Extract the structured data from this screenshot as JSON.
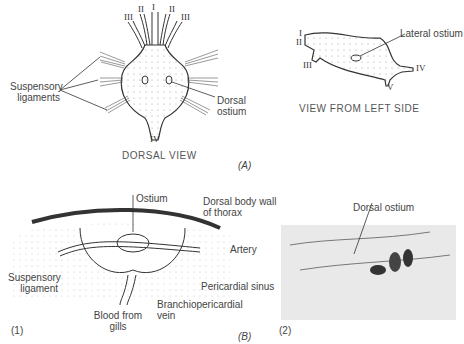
{
  "panel_a": {
    "panel_label": "(A)",
    "dorsal_view": {
      "caption": "DORSAL VIEW",
      "labels": {
        "suspensory_ligaments": [
          "Suspensory",
          "ligaments"
        ],
        "dorsal_ostium": [
          "Dorsal",
          "ostium"
        ]
      },
      "arteries": {
        "top_center": "I",
        "top_left_inner": "II",
        "top_right_inner": "II",
        "top_left_outer": "III",
        "top_right_outer": "III",
        "bottom": "IV"
      }
    },
    "side_view": {
      "caption": "VIEW FROM LEFT SIDE",
      "labels": {
        "lateral_ostium": "Lateral ostium"
      },
      "arteries": {
        "a1": "I",
        "a2": "II",
        "a3": "III",
        "a4": "IV",
        "a5": "V"
      }
    }
  },
  "panel_b": {
    "panel_label": "(B)",
    "fig1": {
      "number": "(1)",
      "labels": {
        "ostium": "Ostium",
        "dorsal_body_wall": [
          "Dorsal body wall",
          "of thorax"
        ],
        "artery": "Artery",
        "suspensory_ligament": [
          "Suspensory",
          "ligament"
        ],
        "pericardial_sinus": "Pericardial sinus",
        "branchiopericardial_vein": [
          "Branchiopericardial",
          "vein"
        ],
        "blood_from_gills": [
          "Blood from",
          "gills"
        ]
      }
    },
    "fig2": {
      "number": "(2)",
      "labels": {
        "dorsal_ostium": "Dorsal ostium"
      }
    }
  }
}
